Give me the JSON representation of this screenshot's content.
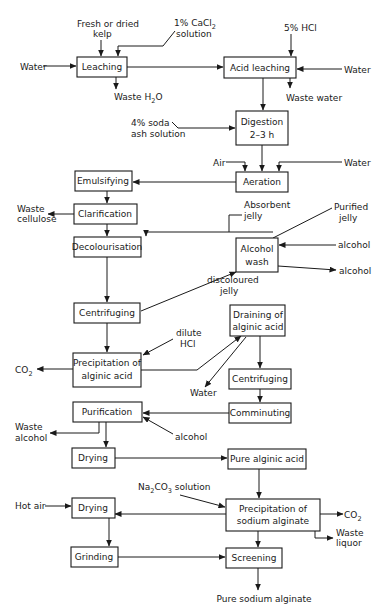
{
  "boxes": {
    "leaching": "Leaching",
    "acid_leaching": "Acid leaching",
    "digestion_1": "Digestion",
    "digestion_2": "2–3 h",
    "aeration": "Aeration",
    "emulsifying": "Emulsifying",
    "clarification": "Clarification",
    "decolourisation": "Decolourisation",
    "alcohol_wash_1": "Alcohol",
    "alcohol_wash_2": "wash",
    "centrifuging_1": "Centrifuging",
    "draining_1": "Draining of",
    "draining_2": "alginic acid",
    "precip_acid_1": "Precipitation of",
    "precip_acid_2": "alginic acid",
    "centrifuging_2": "Centrifuging",
    "purification": "Purification",
    "comminuting": "Comminuting",
    "drying_1": "Drying",
    "pure_alginic_acid": "Pure alginic acid",
    "drying_2": "Drying",
    "precip_sodium_1": "Precipitation of",
    "precip_sodium_2": "sodium alginate",
    "grinding": "Grinding",
    "screening": "Screening"
  },
  "labels": {
    "fresh_kelp_1": "Fresh or dried",
    "fresh_kelp_2": "kelp",
    "cacl2_1": "1% CaCl",
    "cacl2_sub": "2",
    "cacl2_2": "solution",
    "hcl5": "5% HCl",
    "water_in_left": "Water",
    "water_in_right": "Water",
    "waste_h2o": "Waste H",
    "waste_h2o_sub": "2",
    "waste_h2o_end": "O",
    "waste_water": "Waste water",
    "soda_ash_1": "4% soda",
    "soda_ash_2": "ash solution",
    "air": "Air",
    "water_aeration": "Water",
    "waste_cellulose_1": "Waste",
    "waste_cellulose_2": "cellulose",
    "absorbent_jelly_1": "Absorbent",
    "absorbent_jelly_2": "jelly",
    "purified_jelly_1": "Purified",
    "purified_jelly_2": "jelly",
    "alcohol_in": "alcohol",
    "alcohol_out": "alcohol",
    "discoloured_1": "discoloured",
    "discoloured_2": "jelly",
    "dilute_hcl_1": "dilute",
    "dilute_hcl_2": "HCl",
    "co2_left": "CO",
    "co2_left_sub": "2",
    "water_drain": "Water",
    "waste_alcohol_1": "Waste",
    "waste_alcohol_2": "alcohol",
    "alcohol_purif": "alcohol",
    "na2co3_1": "Na",
    "na2co3_s1": "2",
    "na2co3_2": "CO",
    "na2co3_s2": "3",
    "na2co3_3": " solution",
    "hot_air": "Hot air",
    "co2_right": "CO",
    "co2_right_sub": "2",
    "waste_liquor_1": "Waste",
    "waste_liquor_2": "liquor",
    "pure_sodium_alginate": "Pure sodium alginate"
  }
}
